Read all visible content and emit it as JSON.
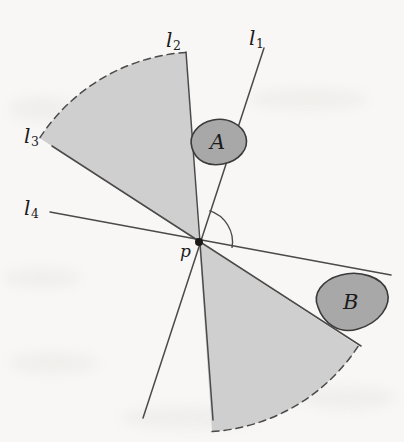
{
  "figure": {
    "type": "geometry-diagram",
    "width": 404,
    "height": 442,
    "background_color": "#f8f7f5",
    "sector_fill_color": "#cfcfcf",
    "sector_stroke_color": "#555555",
    "blob_fill_color": "#a8a8a8",
    "blob_stroke_color": "#3a3a3a",
    "line_color": "#4a4a4a",
    "label_color": "#1b1b1b"
  },
  "point": {
    "name": "p",
    "label": "p",
    "x": 199,
    "y": 242,
    "label_x": 180,
    "label_y": 243
  },
  "lines": [
    {
      "id": "l1",
      "label": "l",
      "subscript": "1",
      "label_x": 249,
      "label_y": 28,
      "x1": 264,
      "y1": 48,
      "x2": 143,
      "y2": 418,
      "angle_deg": 71.9
    },
    {
      "id": "l2",
      "label": "l",
      "subscript": "2",
      "label_x": 166,
      "label_y": 30,
      "x1": 186,
      "y1": 52,
      "x2": 213,
      "y2": 420,
      "angle_deg": -85.8
    },
    {
      "id": "l3",
      "label": "l",
      "subscript": "3",
      "label_x": 24,
      "label_y": 126,
      "x1": 52,
      "y1": 146,
      "x2": 361,
      "y2": 346,
      "angle_deg": -32.9
    },
    {
      "id": "l4",
      "label": "l",
      "subscript": "4",
      "label_x": 24,
      "label_y": 198,
      "x1": 50,
      "y1": 212,
      "x2": 391,
      "y2": 275,
      "angle_deg": -10.5
    }
  ],
  "angle_arc": {
    "name": "angle-at-p",
    "radius": 33,
    "from_deg": 0,
    "to_deg": 71.9,
    "label": ""
  },
  "sectors": [
    {
      "id": "upper-left-sector",
      "fill": "#cfcfcf",
      "bounded_by": [
        "l2",
        "l3"
      ],
      "far_boundary": "dashed-arc",
      "radius": 190
    },
    {
      "id": "lower-right-sector",
      "fill": "#cfcfcf",
      "bounded_by": [
        "l2",
        "l3"
      ],
      "far_boundary": "dashed-arc",
      "radius": 190
    }
  ],
  "regions": [
    {
      "id": "region-a",
      "label": "A",
      "cx": 218,
      "cy": 143,
      "rx": 28,
      "ry": 20,
      "rotation_deg": -24,
      "label_x": 210,
      "label_y": 132,
      "fill": "#a8a8a8"
    },
    {
      "id": "region-b",
      "label": "B",
      "cx": 352,
      "cy": 303,
      "rx": 36,
      "ry": 27,
      "rotation_deg": -18,
      "label_x": 343,
      "label_y": 292,
      "fill": "#a8a8a8"
    }
  ]
}
